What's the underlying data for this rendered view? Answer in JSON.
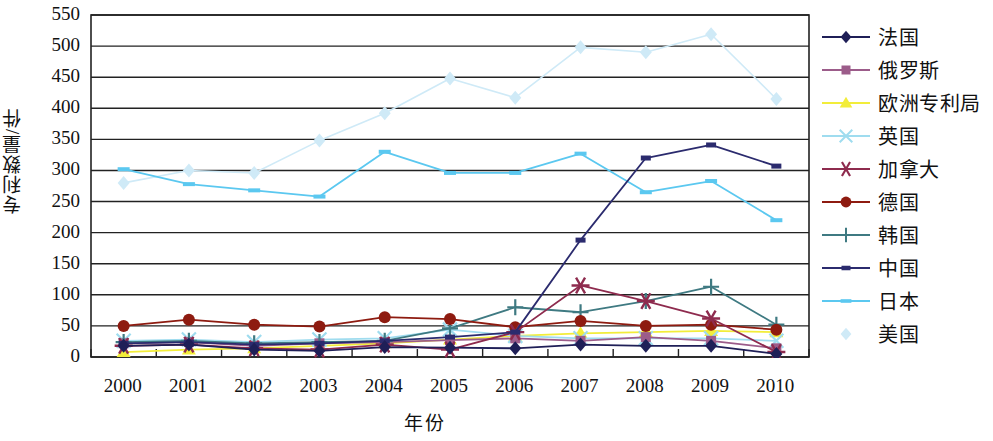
{
  "chart_data": {
    "type": "line",
    "title": "",
    "xlabel": "年份",
    "ylabel": "专利数量/件",
    "x": [
      2000,
      2001,
      2002,
      2003,
      2004,
      2005,
      2006,
      2007,
      2008,
      2009,
      2010
    ],
    "x_tick_labels": [
      "2000",
      "2001",
      "2002",
      "2003",
      "2004",
      "2005",
      "2006",
      "2007",
      "2008",
      "2009",
      "2010"
    ],
    "y_tick_labels": [
      "0",
      "50",
      "100",
      "150",
      "200",
      "250",
      "300",
      "350",
      "400",
      "450",
      "500",
      "550"
    ],
    "ylim": [
      0,
      550
    ],
    "y_tick_step": 50,
    "grid": "horizontal",
    "legend_position": "right",
    "series": [
      {
        "name": "法国",
        "color": "#1f1f57",
        "marker": "diamond",
        "values": [
          18,
          20,
          12,
          10,
          16,
          15,
          14,
          20,
          18,
          18,
          5
        ]
      },
      {
        "name": "俄罗斯",
        "color": "#9c5c8a",
        "marker": "square",
        "values": [
          22,
          24,
          18,
          22,
          24,
          27,
          30,
          26,
          32,
          26,
          14
        ]
      },
      {
        "name": "欧洲专利局",
        "color": "#f2ed3a",
        "marker": "triangle",
        "values": [
          8,
          12,
          14,
          18,
          22,
          28,
          34,
          38,
          40,
          42,
          40
        ]
      },
      {
        "name": "英国",
        "color": "#9fdcef",
        "marker": "x",
        "values": [
          26,
          28,
          24,
          28,
          30,
          44,
          34,
          30,
          30,
          30,
          26
        ]
      },
      {
        "name": "加拿大",
        "color": "#8e2b4e",
        "marker": "asterisk",
        "values": [
          18,
          20,
          14,
          12,
          20,
          12,
          40,
          115,
          90,
          62,
          8
        ]
      },
      {
        "name": "德国",
        "color": "#8e1b10",
        "marker": "circle",
        "values": [
          50,
          60,
          52,
          49,
          64,
          61,
          48,
          58,
          50,
          52,
          44
        ]
      },
      {
        "name": "韩国",
        "color": "#3f7a82",
        "marker": "plus",
        "values": [
          24,
          26,
          22,
          24,
          26,
          46,
          80,
          72,
          90,
          113,
          52
        ]
      },
      {
        "name": "中国",
        "color": "#2b2b6e",
        "marker": "dash",
        "values": [
          22,
          24,
          20,
          22,
          26,
          32,
          40,
          188,
          320,
          341,
          307
        ]
      },
      {
        "name": "日本",
        "color": "#5bc8f0",
        "marker": "line",
        "values": [
          302,
          278,
          268,
          258,
          330,
          296,
          296,
          327,
          265,
          283,
          220
        ]
      },
      {
        "name": "美国",
        "color": "#cfeaf7",
        "marker": "diamond-light",
        "values": [
          280,
          300,
          296,
          348,
          392,
          448,
          417,
          498,
          490,
          519,
          415
        ]
      }
    ]
  }
}
